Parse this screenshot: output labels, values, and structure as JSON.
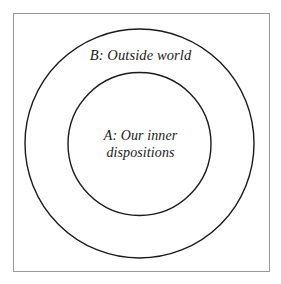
{
  "diagram": {
    "type": "concentric-circles",
    "background_color": "#ffffff",
    "frame": {
      "border_color": "#9a9a9a",
      "stroke_color": "#1a1a1a"
    },
    "outer_region": {
      "label": "B: Outside world",
      "key": "B",
      "name": "Outside world"
    },
    "inner_region": {
      "label": "A: Our inner\ndispositions",
      "key": "A",
      "name": "Our inner dispositions",
      "line1": "A: Our inner",
      "line2": "dispositions"
    }
  }
}
